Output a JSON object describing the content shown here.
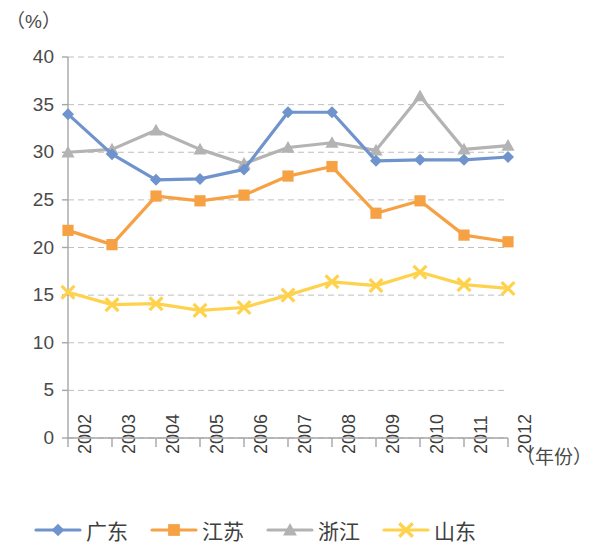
{
  "chart_data": {
    "type": "line",
    "title": "",
    "subtitle": "",
    "xlabel": "（年份）",
    "ylabel": "（%）",
    "categories": [
      "2002",
      "2003",
      "2004",
      "2005",
      "2006",
      "2007",
      "2008",
      "2009",
      "2010",
      "2011",
      "2012"
    ],
    "x_tick_labels": [
      "2002",
      "2003",
      "2004",
      "2005",
      "2006",
      "2007",
      "2008",
      "2009",
      "2010",
      "2011",
      "2012"
    ],
    "y_tick_labels": [
      "0",
      "5",
      "10",
      "15",
      "20",
      "25",
      "30",
      "35",
      "40"
    ],
    "y_ticks": [
      0,
      5,
      10,
      15,
      20,
      25,
      30,
      35,
      40
    ],
    "ylim": [
      0,
      40
    ],
    "grid": "horizontal-dashed",
    "legend_position": "bottom",
    "series": [
      {
        "name": "广东",
        "color": "#6f94cd",
        "marker": "diamond",
        "values": [
          34.0,
          29.8,
          27.1,
          27.2,
          28.2,
          34.2,
          34.2,
          29.1,
          29.2,
          29.2,
          29.5
        ]
      },
      {
        "name": "江苏",
        "color": "#f5a144",
        "marker": "square",
        "values": [
          21.8,
          20.3,
          25.4,
          24.9,
          25.5,
          27.5,
          28.5,
          23.6,
          24.9,
          21.3,
          20.6
        ]
      },
      {
        "name": "浙江",
        "color": "#b3b3b3",
        "marker": "triangle",
        "values": [
          30.0,
          30.3,
          32.3,
          30.3,
          28.8,
          30.5,
          31.0,
          30.2,
          35.9,
          30.3,
          30.7
        ]
      },
      {
        "name": "山东",
        "color": "#ffd24d",
        "marker": "cross",
        "values": [
          15.3,
          14.0,
          14.1,
          13.4,
          13.7,
          15.0,
          16.4,
          16.0,
          17.4,
          16.1,
          15.7
        ]
      }
    ]
  },
  "legend": {
    "items": [
      {
        "label": "广东",
        "color": "#6f94cd",
        "marker": "diamond"
      },
      {
        "label": "江苏",
        "color": "#f5a144",
        "marker": "square"
      },
      {
        "label": "浙江",
        "color": "#b3b3b3",
        "marker": "triangle"
      },
      {
        "label": "山东",
        "color": "#ffd24d",
        "marker": "cross"
      }
    ]
  },
  "axes": {
    "y_unit": "（%）",
    "x_title": "（年份）"
  }
}
